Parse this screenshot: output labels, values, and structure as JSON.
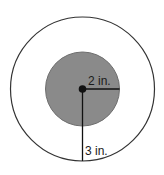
{
  "diagram": {
    "inner_circle": {
      "radius_label": "2 in.",
      "fill": "#8a8a8a",
      "stroke": "#555555"
    },
    "outer_circle": {
      "radius_label": "3 in.",
      "fill": "#ffffff",
      "stroke": "#333333"
    },
    "center_dot_color": "#111111"
  }
}
